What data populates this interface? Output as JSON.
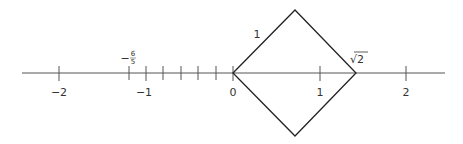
{
  "number_line": {
    "range": [
      -2.4,
      2.4
    ],
    "major_ticks": [
      {
        "value": -2,
        "label": "−2"
      },
      {
        "value": -1,
        "label": "−1"
      },
      {
        "value": 0,
        "label": "0"
      },
      {
        "value": 1,
        "label": "1"
      },
      {
        "value": 2,
        "label": "2"
      }
    ],
    "minor_ticks": [
      -0.8,
      -0.6,
      -0.4,
      -0.2
    ],
    "special_points": [
      {
        "value": -1.2,
        "label_minus": "−",
        "label_num": "6",
        "label_den": "5"
      },
      {
        "value": 1.41421,
        "label": "√2"
      }
    ]
  },
  "square": {
    "side_label": "1",
    "vertices": [
      "0",
      "top",
      "√2",
      "bottom"
    ]
  }
}
